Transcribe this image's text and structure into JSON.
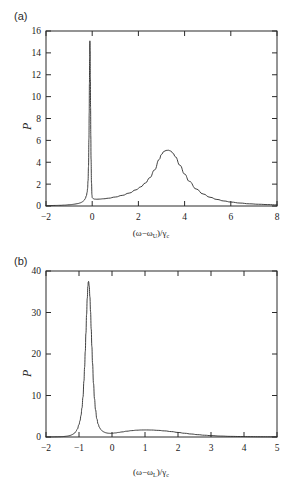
{
  "figure": {
    "panels": [
      {
        "id": "a",
        "label": "(a)",
        "ylabel": "P",
        "xlabel_html": "(ω−ω<sub>U</sub>)/γ<sub>c</sub>",
        "xlabel_plain": "(ω−ω_U)/γ_c"
      },
      {
        "id": "b",
        "label": "(b)",
        "ylabel": "P",
        "xlabel_html": "(ω−ω<sub>L</sub>)/γ<sub>c</sub>",
        "xlabel_plain": "(ω−ω_L)/γ_c"
      }
    ],
    "line_color": "#2b2b2b",
    "background_color": "#ffffff"
  },
  "chart_data": [
    {
      "type": "line",
      "panel": "a",
      "title": "",
      "xlabel": "(ω−ω_U)/γ_c",
      "ylabel": "P",
      "xlim": [
        -2,
        8
      ],
      "ylim": [
        0,
        16
      ],
      "xticks": [
        -2,
        0,
        2,
        4,
        6,
        8
      ],
      "xticklabels": [
        "−2",
        "0",
        "2",
        "4",
        "6",
        "8"
      ],
      "yticks": [
        0,
        2,
        4,
        6,
        8,
        10,
        12,
        14,
        16
      ],
      "yticklabels": [
        "0",
        "2",
        "4",
        "6",
        "8",
        "10",
        "12",
        "14",
        "16"
      ],
      "grid": false,
      "legend": null,
      "annotations": [],
      "features": [
        {
          "kind": "narrow-peak",
          "center": -0.1,
          "height": 15.1,
          "hwhm": 0.05
        },
        {
          "kind": "broad-peak",
          "center": 3.3,
          "height": 5.1,
          "hwhm": 0.75
        }
      ],
      "x": [
        -2.0,
        -1.8,
        -1.6,
        -1.4,
        -1.2,
        -1.0,
        -0.9,
        -0.8,
        -0.7,
        -0.6,
        -0.5,
        -0.45,
        -0.4,
        -0.35,
        -0.3,
        -0.25,
        -0.22,
        -0.2,
        -0.18,
        -0.16,
        -0.14,
        -0.13,
        -0.12,
        -0.11,
        -0.1,
        -0.09,
        -0.08,
        -0.07,
        -0.06,
        -0.05,
        -0.03,
        -0.01,
        0.0,
        0.05,
        0.1,
        0.2,
        0.3,
        0.5,
        0.7,
        1.0,
        1.3,
        1.6,
        1.9,
        2.1,
        2.3,
        2.5,
        2.7,
        2.9,
        3.0,
        3.1,
        3.2,
        3.3,
        3.4,
        3.5,
        3.6,
        3.8,
        4.0,
        4.2,
        4.5,
        4.8,
        5.1,
        5.4,
        5.7,
        6.0,
        6.4,
        6.8,
        7.2,
        7.6,
        8.0
      ],
      "y": [
        0.03,
        0.04,
        0.05,
        0.06,
        0.08,
        0.11,
        0.13,
        0.16,
        0.19,
        0.23,
        0.3,
        0.35,
        0.42,
        0.52,
        0.68,
        0.95,
        1.25,
        1.6,
        2.3,
        3.6,
        6.2,
        8.5,
        11.2,
        13.6,
        15.1,
        14.2,
        11.8,
        9.0,
        6.4,
        4.3,
        2.1,
        1.0,
        0.78,
        0.66,
        0.63,
        0.62,
        0.63,
        0.66,
        0.71,
        0.82,
        0.97,
        1.18,
        1.48,
        1.75,
        2.1,
        2.6,
        3.3,
        4.25,
        4.72,
        4.98,
        5.08,
        5.1,
        5.02,
        4.82,
        4.5,
        3.72,
        2.92,
        2.26,
        1.56,
        1.1,
        0.8,
        0.6,
        0.46,
        0.36,
        0.27,
        0.2,
        0.16,
        0.13,
        0.1
      ]
    },
    {
      "type": "line",
      "panel": "b",
      "title": "",
      "xlabel": "(ω−ω_L)/γ_c",
      "ylabel": "P",
      "xlim": [
        -2,
        5
      ],
      "ylim": [
        0,
        40
      ],
      "xticks": [
        -2,
        -1,
        0,
        1,
        2,
        3,
        4,
        5
      ],
      "xticklabels": [
        "−2",
        "−1",
        "0",
        "1",
        "2",
        "3",
        "4",
        "5"
      ],
      "yticks": [
        0,
        10,
        20,
        30,
        40
      ],
      "yticklabels": [
        "0",
        "10",
        "20",
        "30",
        "40"
      ],
      "grid": false,
      "legend": null,
      "annotations": [],
      "features": [
        {
          "kind": "narrow-peak",
          "center": -0.72,
          "height": 37.5,
          "hwhm": 0.11
        },
        {
          "kind": "broad-bump",
          "center": 1.0,
          "height": 1.7,
          "hwhm": 1.0
        }
      ],
      "x": [
        -2.0,
        -1.9,
        -1.8,
        -1.7,
        -1.6,
        -1.5,
        -1.45,
        -1.4,
        -1.35,
        -1.3,
        -1.25,
        -1.2,
        -1.15,
        -1.1,
        -1.05,
        -1.0,
        -0.97,
        -0.94,
        -0.91,
        -0.88,
        -0.85,
        -0.83,
        -0.81,
        -0.79,
        -0.77,
        -0.75,
        -0.73,
        -0.72,
        -0.71,
        -0.69,
        -0.67,
        -0.65,
        -0.63,
        -0.61,
        -0.59,
        -0.56,
        -0.53,
        -0.5,
        -0.46,
        -0.42,
        -0.38,
        -0.34,
        -0.3,
        -0.25,
        -0.2,
        -0.15,
        -0.1,
        -0.05,
        0.0,
        0.1,
        0.2,
        0.3,
        0.45,
        0.6,
        0.75,
        0.9,
        1.05,
        1.2,
        1.4,
        1.6,
        1.8,
        2.0,
        2.2,
        2.4,
        2.6,
        2.8,
        3.0,
        3.3,
        3.6,
        3.9,
        4.2,
        4.5,
        4.8,
        5.0
      ],
      "y": [
        0.02,
        0.03,
        0.04,
        0.05,
        0.07,
        0.1,
        0.13,
        0.17,
        0.22,
        0.3,
        0.42,
        0.6,
        0.85,
        1.25,
        1.9,
        3.0,
        3.9,
        5.2,
        7.0,
        9.6,
        13.5,
        16.8,
        20.6,
        25.0,
        29.5,
        33.4,
        36.3,
        37.3,
        37.5,
        36.4,
        33.8,
        30.2,
        26.0,
        21.8,
        17.8,
        12.9,
        9.2,
        6.6,
        4.4,
        3.1,
        2.3,
        1.8,
        1.5,
        1.22,
        1.05,
        0.95,
        0.9,
        0.88,
        0.9,
        0.98,
        1.1,
        1.22,
        1.4,
        1.54,
        1.64,
        1.69,
        1.7,
        1.68,
        1.6,
        1.47,
        1.3,
        1.1,
        0.9,
        0.72,
        0.56,
        0.43,
        0.33,
        0.22,
        0.15,
        0.11,
        0.08,
        0.06,
        0.05,
        0.04
      ]
    }
  ]
}
